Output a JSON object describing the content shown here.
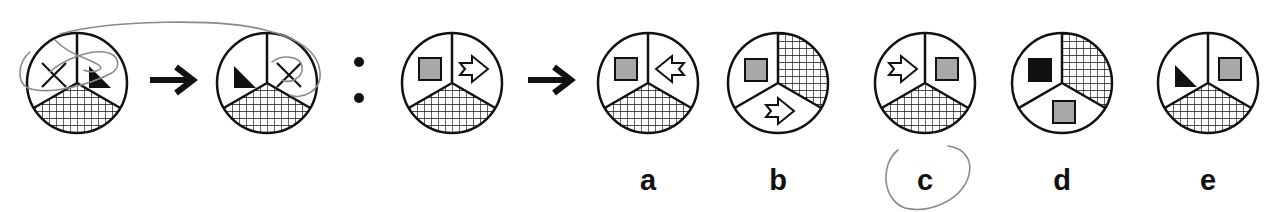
{
  "puzzle": {
    "type": "analogy",
    "description": "A is to B as C is to ?",
    "separator": ":",
    "colors": {
      "ink": "#111111",
      "gray_fill": "#a8a8a8",
      "black_fill": "#111111",
      "pencil": "#8a8a8a"
    },
    "premise": [
      {
        "id": "figure-1",
        "cx": 77,
        "segments": {
          "left": "x-mark",
          "right": "black-triangle",
          "bottom": "crosshatch"
        }
      },
      {
        "id": "figure-2",
        "cx": 267,
        "segments": {
          "left": "black-triangle",
          "right": "x-mark",
          "bottom": "crosshatch"
        }
      }
    ],
    "question": {
      "id": "figure-3",
      "cx": 452,
      "segments": {
        "left": "gray-square",
        "right": "arrow-right-outline",
        "bottom": "crosshatch"
      }
    },
    "options": [
      {
        "label": "a",
        "cx": 648,
        "layout": "Y",
        "segments": {
          "left": "gray-square",
          "right": "arrow-left-outline",
          "bottom": "crosshatch"
        }
      },
      {
        "label": "b",
        "cx": 778,
        "layout": "rotated",
        "segments": {
          "left": "gray-square",
          "upper-right": "crosshatch",
          "bottom": "arrow-right-outline"
        }
      },
      {
        "label": "c",
        "cx": 925,
        "layout": "Y",
        "segments": {
          "left": "arrow-right-outline",
          "right": "gray-square",
          "bottom": "crosshatch"
        },
        "circled_by_hand": true
      },
      {
        "label": "d",
        "cx": 1062,
        "layout": "rotated",
        "segments": {
          "left": "black-square",
          "upper-right": "crosshatch",
          "bottom": "gray-square"
        }
      },
      {
        "label": "e",
        "cx": 1208,
        "layout": "Y",
        "segments": {
          "left": "black-triangle",
          "right": "gray-square",
          "bottom": "crosshatch"
        }
      }
    ]
  },
  "labels": {
    "a": "a",
    "b": "b",
    "c": "c",
    "d": "d",
    "e": "e"
  }
}
